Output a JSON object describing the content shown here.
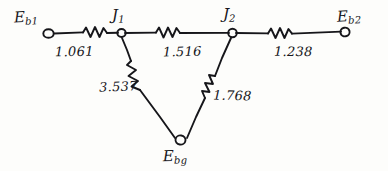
{
  "diagram": {
    "title_fragment_clipped": "",
    "type": "hand-drawn electrical network / resistance diagram",
    "nodes": [
      {
        "id": "Eb1",
        "base": "E",
        "sub": "b1",
        "label": "Eb1",
        "x": 48,
        "y": 33,
        "label_x": 14,
        "label_y": 10
      },
      {
        "id": "J1",
        "base": "J",
        "sub": "1",
        "label": "J1",
        "x": 121,
        "y": 33,
        "label_x": 111,
        "label_y": 9
      },
      {
        "id": "J2",
        "base": "J",
        "sub": "2",
        "label": "J2",
        "x": 232,
        "y": 33,
        "label_x": 222,
        "label_y": 8
      },
      {
        "id": "Eb2",
        "base": "E",
        "sub": "b2",
        "label": "Eb2",
        "x": 345,
        "y": 33,
        "label_x": 337,
        "label_y": 10
      },
      {
        "id": "Ebg",
        "base": "E",
        "sub": "bg",
        "label": "Ebg",
        "x": 180,
        "y": 143,
        "label_x": 162,
        "label_y": 150
      }
    ],
    "branches": [
      {
        "id": "b1-j1",
        "from": "Eb1",
        "to": "J1",
        "value": "1.061",
        "label_x": 55,
        "label_y": 44
      },
      {
        "id": "j1-j2",
        "from": "J1",
        "to": "J2",
        "value": "1.516",
        "label_x": 163,
        "label_y": 44
      },
      {
        "id": "j2-b2",
        "from": "J2",
        "to": "Eb2",
        "value": "1.238",
        "label_x": 274,
        "label_y": 44
      },
      {
        "id": "j1-bg",
        "from": "J1",
        "to": "Ebg",
        "value": "3.537",
        "label_x": 100,
        "label_y": 80
      },
      {
        "id": "j2-bg",
        "from": "J2",
        "to": "Ebg",
        "value": "1.768",
        "label_x": 212,
        "label_y": 88
      }
    ],
    "colors": {
      "ink": "#16161a",
      "paper": "#fdfdfb",
      "smudge": "#bdbdbd"
    }
  }
}
